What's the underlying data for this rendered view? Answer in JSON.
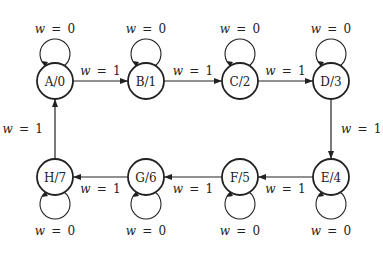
{
  "diagram": {
    "type": "state-diagram",
    "colors": {
      "stroke": "#222222",
      "background": "#ffffff",
      "text": "#222222"
    },
    "nodes": [
      {
        "id": "A",
        "label": "A/0",
        "x": 55,
        "y": 81
      },
      {
        "id": "B",
        "label": "B/1",
        "x": 146,
        "y": 81
      },
      {
        "id": "C",
        "label": "C/2",
        "x": 240,
        "y": 81
      },
      {
        "id": "D",
        "label": "D/3",
        "x": 331,
        "y": 81
      },
      {
        "id": "E",
        "label": "E/4",
        "x": 331,
        "y": 177
      },
      {
        "id": "F",
        "label": "F/5",
        "x": 240,
        "y": 177
      },
      {
        "id": "G",
        "label": "G/6",
        "x": 146,
        "y": 177
      },
      {
        "id": "H",
        "label": "H/7",
        "x": 55,
        "y": 177
      }
    ],
    "edges": [
      {
        "from": "A",
        "to": "B",
        "label": "w = 1"
      },
      {
        "from": "B",
        "to": "C",
        "label": "w = 1"
      },
      {
        "from": "C",
        "to": "D",
        "label": "w = 1"
      },
      {
        "from": "D",
        "to": "E",
        "label": "w = 1"
      },
      {
        "from": "E",
        "to": "F",
        "label": "w = 1"
      },
      {
        "from": "F",
        "to": "G",
        "label": "w = 1"
      },
      {
        "from": "G",
        "to": "H",
        "label": "w = 1"
      },
      {
        "from": "H",
        "to": "A",
        "label": "w = 1"
      }
    ],
    "self_loops": [
      {
        "node": "A",
        "label": "w = 0",
        "side": "top"
      },
      {
        "node": "B",
        "label": "w = 0",
        "side": "top"
      },
      {
        "node": "C",
        "label": "w = 0",
        "side": "top"
      },
      {
        "node": "D",
        "label": "w = 0",
        "side": "top"
      },
      {
        "node": "E",
        "label": "w = 0",
        "side": "bottom"
      },
      {
        "node": "F",
        "label": "w = 0",
        "side": "bottom"
      },
      {
        "node": "G",
        "label": "w = 0",
        "side": "bottom"
      },
      {
        "node": "H",
        "label": "w = 0",
        "side": "bottom"
      }
    ]
  }
}
